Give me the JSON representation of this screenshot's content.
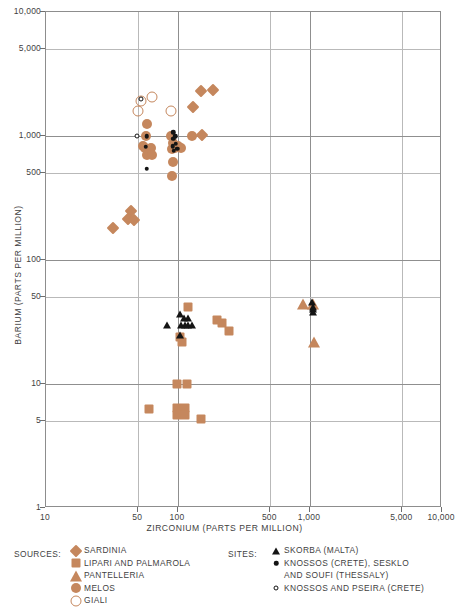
{
  "chart_data": {
    "type": "scatter",
    "title": "",
    "xlabel": "ZIRCONIUM (PARTS PER MILLION)",
    "ylabel": "BARIUM (PARTS PER MILLION)",
    "xscale": "log",
    "yscale": "log",
    "xlim": [
      10,
      10000
    ],
    "ylim": [
      1,
      10000
    ],
    "grid": true,
    "xticks": [
      10,
      50,
      100,
      500,
      1000,
      5000,
      10000
    ],
    "xtick_labels": [
      "10",
      "50",
      "100",
      "500",
      "1,000",
      "5,000",
      "10,000"
    ],
    "yticks": [
      1,
      5,
      10,
      50,
      100,
      500,
      1000,
      5000,
      10000
    ],
    "ytick_labels": [
      "1",
      "5",
      "10",
      "50",
      "100",
      "500",
      "1,000",
      "5,000",
      "10,000"
    ],
    "series": [
      {
        "name": "SARDINIA",
        "marker": "diamond",
        "color": "#c5875d",
        "group": "sources",
        "points": [
          [
            150,
            2300
          ],
          [
            185,
            2350
          ],
          [
            130,
            1700
          ],
          [
            152,
            1020
          ],
          [
            32,
            180
          ],
          [
            44,
            250
          ],
          [
            42,
            215
          ],
          [
            46,
            210
          ]
        ]
      },
      {
        "name": "LIPARI AND PALMAROLA",
        "marker": "square",
        "color": "#c5875d",
        "group": "sources",
        "points": [
          [
            118,
            42
          ],
          [
            196,
            33
          ],
          [
            216,
            31
          ],
          [
            245,
            27
          ],
          [
            104,
            24
          ],
          [
            107,
            22
          ],
          [
            98,
            10
          ],
          [
            116,
            10
          ],
          [
            60,
            6.3
          ],
          [
            98,
            6.4
          ],
          [
            113,
            6.4
          ],
          [
            98,
            5.6
          ],
          [
            113,
            5.6
          ],
          [
            150,
            5.2
          ]
        ]
      },
      {
        "name": "PANTELLERIA",
        "marker": "triangle",
        "color": "#c5875d",
        "group": "sources",
        "points": [
          [
            880,
            44
          ],
          [
            1050,
            44
          ],
          [
            1080,
            22
          ]
        ]
      },
      {
        "name": "MELOS",
        "marker": "circle",
        "color": "#c5875d",
        "group": "sources",
        "points": [
          [
            58,
            1250
          ],
          [
            57,
            1000
          ],
          [
            54,
            830
          ],
          [
            56,
            800
          ],
          [
            60,
            770
          ],
          [
            62,
            800
          ],
          [
            58,
            700
          ],
          [
            64,
            700
          ],
          [
            89,
            1000
          ],
          [
            92,
            880
          ],
          [
            95,
            800
          ],
          [
            90,
            790
          ],
          [
            100,
            830
          ],
          [
            92,
            620
          ],
          [
            90,
            480
          ],
          [
            106,
            800
          ],
          [
            128,
            1000
          ]
        ]
      },
      {
        "name": "GIALI",
        "marker": "open-circle",
        "color": "#c5875d",
        "group": "sources",
        "points": [
          [
            52,
            1900
          ],
          [
            63,
            2050
          ],
          [
            50,
            1600
          ],
          [
            88,
            1600
          ]
        ]
      },
      {
        "name": "SKORBA (MALTA)",
        "marker": "triangle-black",
        "color": "#141414",
        "group": "sites",
        "points": [
          [
            83,
            30
          ],
          [
            104,
            37
          ],
          [
            110,
            34
          ],
          [
            118,
            34
          ],
          [
            106,
            30
          ],
          [
            112,
            30
          ],
          [
            119,
            30
          ],
          [
            128,
            30
          ],
          [
            103,
            25
          ],
          [
            1040,
            46
          ],
          [
            1050,
            42
          ],
          [
            1060,
            40
          ],
          [
            1045,
            38
          ]
        ]
      },
      {
        "name": "KNOSSOS (CRETE), SESKLO AND SOUFI (THESSALY)",
        "marker": "dot",
        "color": "#141414",
        "group": "sites",
        "points": [
          [
            58,
            1000
          ],
          [
            57,
            820
          ],
          [
            92,
            1070
          ],
          [
            92,
            950
          ],
          [
            91,
            830
          ],
          [
            93,
            760
          ],
          [
            95,
            1000
          ],
          [
            96,
            870
          ],
          [
            58,
            545
          ],
          [
            99,
            790
          ]
        ]
      },
      {
        "name": "KNOSSOS AND PSEIRA (CRETE)",
        "marker": "tiny-open-circle",
        "color": "#141414",
        "group": "sites",
        "points": [
          [
            49,
            1000
          ],
          [
            52,
            2000
          ]
        ]
      }
    ]
  },
  "legend": {
    "sources_heading": "SOURCES:",
    "sites_heading": "SITES:",
    "sources": [
      {
        "label": "SARDINIA",
        "marker": "diamond"
      },
      {
        "label": "LIPARI AND PALMAROLA",
        "marker": "square"
      },
      {
        "label": "PANTELLERIA",
        "marker": "triangle"
      },
      {
        "label": "MELOS",
        "marker": "circle"
      },
      {
        "label": "GIALI",
        "marker": "open-circle"
      }
    ],
    "sites": [
      {
        "label": "SKORBA (MALTA)",
        "label2": "",
        "marker": "triangle-black"
      },
      {
        "label": "KNOSSOS (CRETE), SESKLO",
        "label2": "AND SOUFI  (THESSALY)",
        "marker": "dot"
      },
      {
        "label": "KNOSSOS AND PSEIRA (CRETE)",
        "label2": "",
        "marker": "tiny-open-circle"
      }
    ]
  },
  "colors": {
    "source_orange": "#c5875d",
    "site_black": "#141414",
    "grid": "#b9b9b9",
    "frame": "#8d8d8d"
  }
}
